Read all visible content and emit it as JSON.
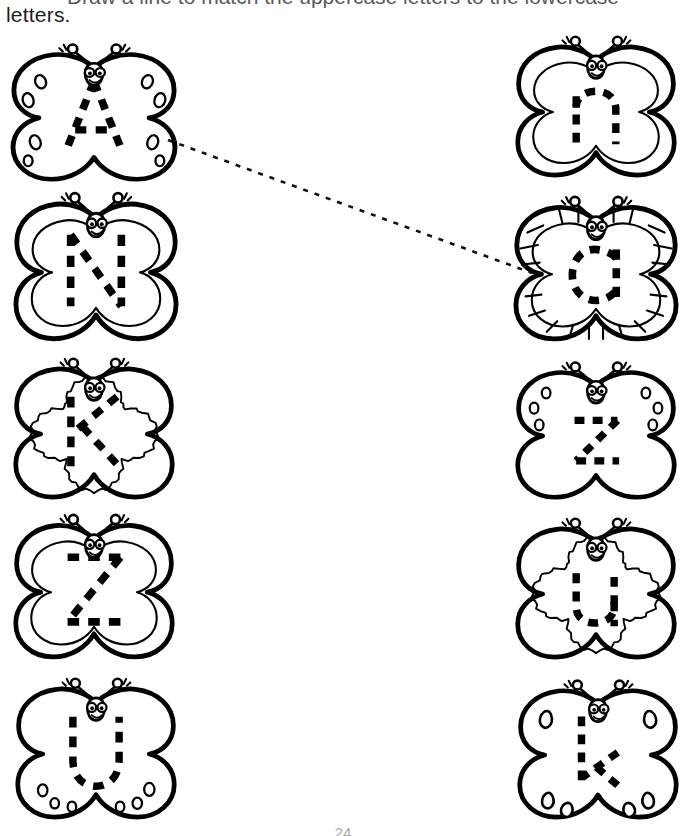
{
  "worksheet": {
    "instruction_line_1": "Draw a line to match the uppercase letters to the lowercase",
    "instruction_line_2": "letters.",
    "page_number": "24"
  },
  "style": {
    "ink": "#000000",
    "paper": "#ffffff",
    "connector_color": "#111111"
  },
  "left_column": {
    "title": "uppercase-butterflies",
    "items": [
      {
        "letter": "A",
        "case": "uppercase",
        "wing_style": "oval-spots",
        "x": 5,
        "y": 38,
        "width": 178,
        "height": 148
      },
      {
        "letter": "N",
        "case": "uppercase",
        "wing_style": "double-outline",
        "x": 8,
        "y": 186,
        "width": 176,
        "height": 160
      },
      {
        "letter": "K",
        "case": "uppercase",
        "wing_style": "wavy-inner-outline",
        "x": 8,
        "y": 352,
        "width": 172,
        "height": 152
      },
      {
        "letter": "Z",
        "case": "uppercase",
        "wing_style": "double-outline",
        "x": 8,
        "y": 508,
        "width": 172,
        "height": 156
      },
      {
        "letter": "U",
        "case": "uppercase",
        "wing_style": "round-spots-lower",
        "x": 10,
        "y": 672,
        "width": 172,
        "height": 152
      }
    ]
  },
  "right_column": {
    "title": "lowercase-butterflies",
    "items": [
      {
        "letter": "n",
        "case": "lowercase",
        "wing_style": "double-outline",
        "x": 510,
        "y": 30,
        "width": 172,
        "height": 152
      },
      {
        "letter": "a",
        "case": "lowercase",
        "wing_style": "segmented-border",
        "x": 508,
        "y": 190,
        "width": 176,
        "height": 156
      },
      {
        "letter": "z",
        "case": "lowercase",
        "wing_style": "round-spots-upper",
        "x": 510,
        "y": 356,
        "width": 172,
        "height": 148
      },
      {
        "letter": "u",
        "case": "lowercase",
        "wing_style": "wavy-inner-outline",
        "x": 510,
        "y": 512,
        "width": 172,
        "height": 152
      },
      {
        "letter": "k",
        "case": "lowercase",
        "wing_style": "teardrop-tips",
        "x": 512,
        "y": 674,
        "width": 172,
        "height": 150
      }
    ]
  },
  "connections": [
    {
      "from_letter": "A",
      "to_letter": "a",
      "x1": 168,
      "y1": 140,
      "x2": 532,
      "y2": 273
    }
  ]
}
